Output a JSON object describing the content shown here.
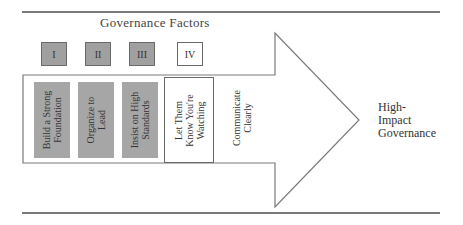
{
  "diagram": {
    "heading": "Governance Factors",
    "factor_boxes": [
      {
        "label": "I",
        "filled": true
      },
      {
        "label": "II",
        "filled": true
      },
      {
        "label": "III",
        "filled": true
      },
      {
        "label": "IV",
        "filled": false
      }
    ],
    "columns": [
      {
        "line1": "Build a Strong",
        "line2": "Foundation",
        "line3": "",
        "style": "filled"
      },
      {
        "line1": "Organize to",
        "line2": "Lead",
        "line3": "",
        "style": "filled"
      },
      {
        "line1": "Insist on High",
        "line2": "Standards",
        "line3": "",
        "style": "filled"
      },
      {
        "line1": "Let Them",
        "line2": "Know You're",
        "line3": "Watching",
        "style": "outlined"
      },
      {
        "line1": "Communicate",
        "line2": "Clearly",
        "line3": "",
        "style": "plain"
      }
    ],
    "outcome": {
      "line1": "High-",
      "line2": "Impact",
      "line3": "Governance"
    },
    "colors": {
      "filled_gray": "#a6a6a6",
      "line_gray": "#7a7a7a"
    }
  }
}
